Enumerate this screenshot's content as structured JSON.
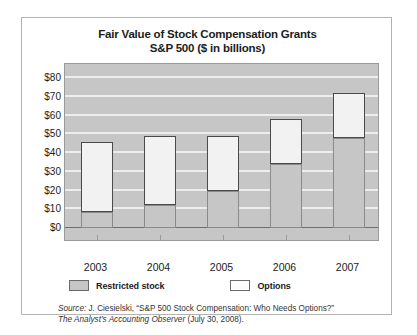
{
  "chart_data": {
    "type": "bar",
    "subtype": "stacked-vertical",
    "title": "Fair Value of Stock Compensation Grants",
    "subtitle": "S&P 500  ($ in billions)",
    "xlabel": "",
    "ylabel": "",
    "categories": [
      "2003",
      "2004",
      "2005",
      "2006",
      "2007"
    ],
    "series": [
      {
        "name": "Restricted stock",
        "values": [
          8.5,
          12.5,
          20,
          34,
          48
        ],
        "color": "#c6c6c6"
      },
      {
        "name": "Options",
        "values": [
          37.5,
          36.5,
          29,
          24,
          24
        ],
        "color": "#f2f2f2"
      }
    ],
    "totals": [
      46,
      49,
      49,
      58,
      72
    ],
    "ylim": [
      0,
      80
    ],
    "ytick_values": [
      0,
      10,
      20,
      30,
      40,
      50,
      60,
      70,
      80
    ],
    "ytick_labels": [
      "$0",
      "$10",
      "$20",
      "$30",
      "$40",
      "$50",
      "$60",
      "$70",
      "$80"
    ],
    "grid": true,
    "legend_position": "bottom-left",
    "plot_background": "#c6c6c6"
  },
  "legend": {
    "entries": [
      {
        "label": "Restricted stock",
        "swatch": "restricted-stock-swatch"
      },
      {
        "label": "Options",
        "swatch": "options-swatch"
      }
    ]
  },
  "source": {
    "line1_prefix": "Source:",
    "line1": " J. Ciesielski, “S&P 500 Stock Compensation: Who Needs Options?”",
    "line2_italic": "The Analyst’s Accounting Observer",
    "line2_rest": " (July 30, 2008)."
  }
}
